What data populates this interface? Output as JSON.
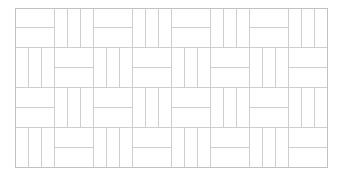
{
  "figure": {
    "kind": "basketweave-tile-pattern",
    "canvas_width": 341,
    "canvas_height": 178,
    "background_color": "#ffffff"
  },
  "style": {
    "line_color": "#c9c9c9",
    "border_color": "#c2c2c2",
    "line_width": 0.9,
    "border_width": 1.0,
    "tile_fill": "#ffffff"
  },
  "grid": {
    "origin_x": 15,
    "origin_y": 8,
    "block_width": 39,
    "block_height": 39.75,
    "rows": 4,
    "cols": 8,
    "clip_x": 327,
    "clip_y": 167,
    "planks_per_vertical_block": 3,
    "planks_per_horizontal_block": 2,
    "row_start_orientations": [
      "horizontal",
      "vertical",
      "horizontal",
      "vertical"
    ]
  },
  "blocks": [
    {
      "row": 0,
      "col": 0,
      "orientation": "horizontal"
    },
    {
      "row": 0,
      "col": 1,
      "orientation": "vertical"
    },
    {
      "row": 0,
      "col": 2,
      "orientation": "horizontal"
    },
    {
      "row": 0,
      "col": 3,
      "orientation": "vertical"
    },
    {
      "row": 0,
      "col": 4,
      "orientation": "horizontal"
    },
    {
      "row": 0,
      "col": 5,
      "orientation": "vertical"
    },
    {
      "row": 0,
      "col": 6,
      "orientation": "horizontal"
    },
    {
      "row": 0,
      "col": 7,
      "orientation": "vertical"
    },
    {
      "row": 1,
      "col": 0,
      "orientation": "vertical"
    },
    {
      "row": 1,
      "col": 1,
      "orientation": "horizontal"
    },
    {
      "row": 1,
      "col": 2,
      "orientation": "vertical"
    },
    {
      "row": 1,
      "col": 3,
      "orientation": "horizontal"
    },
    {
      "row": 1,
      "col": 4,
      "orientation": "vertical"
    },
    {
      "row": 1,
      "col": 5,
      "orientation": "horizontal"
    },
    {
      "row": 1,
      "col": 6,
      "orientation": "vertical"
    },
    {
      "row": 1,
      "col": 7,
      "orientation": "horizontal"
    },
    {
      "row": 2,
      "col": 0,
      "orientation": "horizontal"
    },
    {
      "row": 2,
      "col": 1,
      "orientation": "vertical"
    },
    {
      "row": 2,
      "col": 2,
      "orientation": "horizontal"
    },
    {
      "row": 2,
      "col": 3,
      "orientation": "vertical"
    },
    {
      "row": 2,
      "col": 4,
      "orientation": "horizontal"
    },
    {
      "row": 2,
      "col": 5,
      "orientation": "vertical"
    },
    {
      "row": 2,
      "col": 6,
      "orientation": "horizontal"
    },
    {
      "row": 2,
      "col": 7,
      "orientation": "vertical"
    },
    {
      "row": 3,
      "col": 0,
      "orientation": "vertical"
    },
    {
      "row": 3,
      "col": 1,
      "orientation": "horizontal"
    },
    {
      "row": 3,
      "col": 2,
      "orientation": "vertical"
    },
    {
      "row": 3,
      "col": 3,
      "orientation": "horizontal"
    },
    {
      "row": 3,
      "col": 4,
      "orientation": "vertical"
    },
    {
      "row": 3,
      "col": 5,
      "orientation": "horizontal"
    },
    {
      "row": 3,
      "col": 6,
      "orientation": "vertical"
    },
    {
      "row": 3,
      "col": 7,
      "orientation": "horizontal"
    }
  ]
}
